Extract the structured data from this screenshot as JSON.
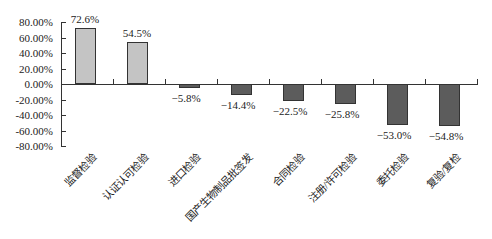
{
  "chart_data": {
    "type": "bar",
    "title": "",
    "xlabel": "",
    "ylabel": "",
    "ylim": [
      -80,
      80
    ],
    "yticks": [
      "80.00%",
      "60.00%",
      "40.00%",
      "20.00%",
      "0.00%",
      "-20.00%",
      "-40.00%",
      "-60.00%",
      "-80.00%"
    ],
    "categories": [
      "监督检验",
      "认证认可检验",
      "进口检验",
      "国产生物制品批签发",
      "合同检验",
      "注册/许可检验",
      "委托检验",
      "复验/复检"
    ],
    "values": [
      72.6,
      54.5,
      -5.8,
      -14.4,
      -22.5,
      -25.8,
      -53.0,
      -54.8
    ],
    "labels": [
      "72.6%",
      "54.5%",
      "−5.8%",
      "−14.4%",
      "−22.5%",
      "−25.8%",
      "−53.0%",
      "−54.8%"
    ],
    "grid": false,
    "legend": null,
    "colors": {
      "positive": "#c4c4c4",
      "negative": "#5c5c5c",
      "border": "#333333"
    }
  }
}
